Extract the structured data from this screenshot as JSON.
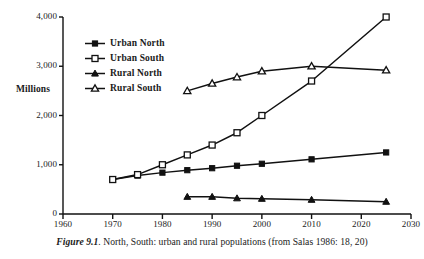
{
  "caption": {
    "figure_number": "Figure 9.1",
    "text": ". North, South: urban and rural populations (from Salas 1986: 18, 20)"
  },
  "legend": {
    "position": "inside-top-left",
    "items": [
      {
        "label": "Urban North",
        "marker": "filled-square-marker",
        "color": "#000000"
      },
      {
        "label": "Urban South",
        "marker": "open-square-marker",
        "color": "#000000"
      },
      {
        "label": "Rural North",
        "marker": "filled-triangle-marker",
        "color": "#000000"
      },
      {
        "label": "Rural South",
        "marker": "open-triangle-marker",
        "color": "#000000"
      }
    ]
  },
  "chart_data": {
    "type": "line",
    "title": "",
    "xlabel": "",
    "ylabel": "Millions",
    "xlim": [
      1960,
      2030
    ],
    "ylim": [
      0,
      4000
    ],
    "xticks": [
      "1960",
      "1970",
      "1980",
      "1990",
      "2000",
      "2010",
      "2020",
      "2030"
    ],
    "xtick_values": [
      1960,
      1970,
      1980,
      1990,
      2000,
      2010,
      2020,
      2030
    ],
    "yticks": [
      "0",
      "1,000",
      "2,000",
      "3,000",
      "4,000"
    ],
    "ytick_values": [
      0,
      1000,
      2000,
      3000,
      4000
    ],
    "grid": false,
    "series": [
      {
        "name": "Urban North",
        "marker": "filled-square-marker",
        "x": [
          1970,
          1975,
          1980,
          1985,
          1990,
          1995,
          2000,
          2010,
          2025
        ],
        "values": [
          700,
          780,
          840,
          890,
          930,
          980,
          1020,
          1110,
          1250
        ]
      },
      {
        "name": "Urban South",
        "marker": "open-square-marker",
        "x": [
          1970,
          1975,
          1980,
          1985,
          1990,
          1995,
          2000,
          2010,
          2025
        ],
        "values": [
          700,
          800,
          1000,
          1200,
          1400,
          1650,
          2000,
          2700,
          4000
        ]
      },
      {
        "name": "Rural North",
        "marker": "filled-triangle-marker",
        "x": [
          1985,
          1990,
          1995,
          2000,
          2010,
          2025
        ],
        "values": [
          350,
          350,
          320,
          310,
          290,
          250
        ]
      },
      {
        "name": "Rural South",
        "marker": "open-triangle-marker",
        "x": [
          1985,
          1990,
          1995,
          2000,
          2010,
          2025
        ],
        "values": [
          2500,
          2650,
          2780,
          2900,
          3000,
          2920
        ]
      }
    ]
  }
}
